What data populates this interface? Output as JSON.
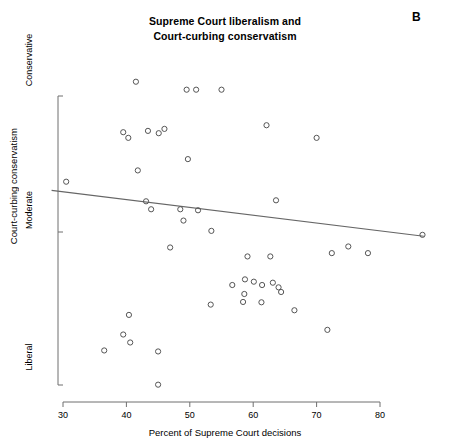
{
  "chart_data": {
    "type": "scatter",
    "title": "Supreme Court liberalism and\nCourt-curbing conservatism",
    "panel_label": "B",
    "xlabel": "Percent of Supreme Court decisions",
    "ylabel": "Court-curbing conservatism",
    "xlim": [
      28,
      83
    ],
    "ylim": [
      0,
      100
    ],
    "xticks": [
      30,
      40,
      50,
      60,
      70,
      80
    ],
    "xtick_labels": [
      "30",
      "40",
      "50",
      "60",
      "70",
      "80"
    ],
    "yticks": [
      5,
      47,
      92
    ],
    "ytick_labels": [
      "Liberal",
      "Moderate",
      "Conservative"
    ],
    "grid": false,
    "legend": null,
    "marker": "open-circle",
    "marker_color": "#555555",
    "line_color": "#666666",
    "points": [
      {
        "x": 30.5,
        "y": 66.2
      },
      {
        "x": 41.5,
        "y": 96.3
      },
      {
        "x": 49.5,
        "y": 93.9
      },
      {
        "x": 51.0,
        "y": 93.9
      },
      {
        "x": 55.0,
        "y": 93.9
      },
      {
        "x": 62.1,
        "y": 83.2
      },
      {
        "x": 70.0,
        "y": 79.4
      },
      {
        "x": 39.5,
        "y": 81.1
      },
      {
        "x": 40.3,
        "y": 79.4
      },
      {
        "x": 43.4,
        "y": 81.5
      },
      {
        "x": 45.1,
        "y": 80.8
      },
      {
        "x": 46.0,
        "y": 82.1
      },
      {
        "x": 41.8,
        "y": 69.6
      },
      {
        "x": 49.7,
        "y": 73.0
      },
      {
        "x": 43.1,
        "y": 60.3
      },
      {
        "x": 43.9,
        "y": 57.9
      },
      {
        "x": 48.5,
        "y": 57.9
      },
      {
        "x": 51.3,
        "y": 57.6
      },
      {
        "x": 49.0,
        "y": 54.5
      },
      {
        "x": 53.4,
        "y": 51.4
      },
      {
        "x": 63.6,
        "y": 60.6
      },
      {
        "x": 46.9,
        "y": 46.4
      },
      {
        "x": 72.4,
        "y": 44.7
      },
      {
        "x": 75.0,
        "y": 46.7
      },
      {
        "x": 78.1,
        "y": 44.7
      },
      {
        "x": 86.7,
        "y": 50.2
      },
      {
        "x": 59.1,
        "y": 43.7
      },
      {
        "x": 62.7,
        "y": 43.7
      },
      {
        "x": 58.7,
        "y": 36.8
      },
      {
        "x": 60.1,
        "y": 36.1
      },
      {
        "x": 61.4,
        "y": 35.1
      },
      {
        "x": 63.1,
        "y": 35.8
      },
      {
        "x": 64.0,
        "y": 34.4
      },
      {
        "x": 64.4,
        "y": 33.0
      },
      {
        "x": 56.7,
        "y": 35.1
      },
      {
        "x": 58.6,
        "y": 32.4
      },
      {
        "x": 58.4,
        "y": 30.0
      },
      {
        "x": 53.3,
        "y": 29.2
      },
      {
        "x": 61.3,
        "y": 29.9
      },
      {
        "x": 66.5,
        "y": 27.5
      },
      {
        "x": 71.7,
        "y": 21.6
      },
      {
        "x": 40.4,
        "y": 26.1
      },
      {
        "x": 39.5,
        "y": 20.2
      },
      {
        "x": 40.6,
        "y": 17.8
      },
      {
        "x": 36.5,
        "y": 15.4
      },
      {
        "x": 45.0,
        "y": 15.1
      },
      {
        "x": 45.0,
        "y": 5.1
      }
    ],
    "fit_line": {
      "x_start": 28.2,
      "y_start": 63.6,
      "x_end": 86.9,
      "y_end": 49.8
    }
  }
}
